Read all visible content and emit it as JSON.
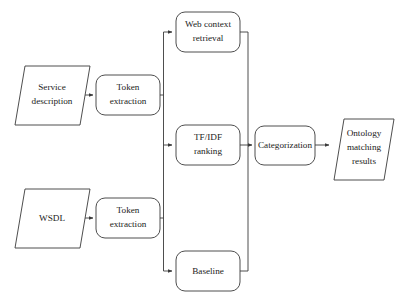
{
  "diagram": {
    "background_color": "#ffffff",
    "stroke_color": "#3a3a3a",
    "text_color": "#1b1b1b",
    "nodes": [
      {
        "id": "service-description",
        "shape": "parallelogram",
        "lines": [
          "Service",
          "description"
        ],
        "label": "Service description"
      },
      {
        "id": "token-extraction-top",
        "shape": "rounded-rect",
        "lines": [
          "Token",
          "extraction"
        ],
        "label": "Token extraction"
      },
      {
        "id": "wsdl",
        "shape": "parallelogram",
        "lines": [
          "WSDL"
        ],
        "label": "WSDL"
      },
      {
        "id": "token-extraction-bottom",
        "shape": "rounded-rect",
        "lines": [
          "Token",
          "extraction"
        ],
        "label": "Token extraction"
      },
      {
        "id": "web-context-retrieval",
        "shape": "rounded-rect",
        "lines": [
          "Web context",
          "retrieval"
        ],
        "label": "Web context retrieval"
      },
      {
        "id": "tfidf-ranking",
        "shape": "rounded-rect",
        "lines": [
          "TF/IDF",
          "ranking"
        ],
        "label": "TF/IDF ranking"
      },
      {
        "id": "baseline",
        "shape": "rounded-rect",
        "lines": [
          "Baseline"
        ],
        "label": "Baseline"
      },
      {
        "id": "categorization",
        "shape": "rounded-rect",
        "lines": [
          "Categorization"
        ],
        "label": "Categorization"
      },
      {
        "id": "ontology-matching-results",
        "shape": "parallelogram",
        "lines": [
          "Ontology",
          "matching",
          "results"
        ],
        "label": "Ontology matching results"
      }
    ],
    "edges": [
      {
        "from": "service-description",
        "to": "token-extraction-top"
      },
      {
        "from": "wsdl",
        "to": "token-extraction-bottom"
      },
      {
        "from": "token-extraction-top",
        "to": "web-context-retrieval"
      },
      {
        "from": "token-extraction-top",
        "to": "tfidf-ranking"
      },
      {
        "from": "token-extraction-top",
        "to": "baseline"
      },
      {
        "from": "token-extraction-bottom",
        "to": "web-context-retrieval"
      },
      {
        "from": "token-extraction-bottom",
        "to": "tfidf-ranking"
      },
      {
        "from": "token-extraction-bottom",
        "to": "baseline"
      },
      {
        "from": "web-context-retrieval",
        "to": "categorization"
      },
      {
        "from": "tfidf-ranking",
        "to": "categorization"
      },
      {
        "from": "baseline",
        "to": "categorization"
      },
      {
        "from": "categorization",
        "to": "ontology-matching-results"
      }
    ]
  }
}
